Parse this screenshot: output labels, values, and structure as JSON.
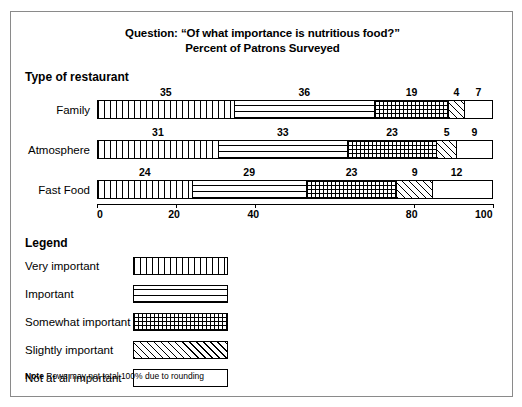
{
  "title": {
    "line1": "Question: “Of what importance is nutritious food?”",
    "line2": "Percent of Patrons Surveyed"
  },
  "type_heading": "Type of restaurant",
  "legend_heading": "Legend",
  "note": {
    "label": "Note",
    "text": " Rows may not total 100% due to rounding"
  },
  "chart_data": {
    "type": "bar",
    "orientation": "horizontal",
    "stacked": true,
    "title": "Question: “Of what importance is nutritious food?” Percent of Patrons Surveyed",
    "xlabel": "",
    "ylabel": "Type of restaurant",
    "xlim": [
      0,
      100
    ],
    "grid": false,
    "legend_position": "below",
    "categories": [
      "Family",
      "Atmosphere",
      "Fast Food"
    ],
    "tick_values": [
      0,
      20,
      40,
      80,
      100
    ],
    "tick_labels": [
      "0",
      "20",
      "40",
      "80",
      "100"
    ],
    "series": [
      {
        "name": "Very important",
        "pattern": "vertical-lines",
        "values": [
          35,
          31,
          24
        ]
      },
      {
        "name": "Important",
        "pattern": "horizontal-lines",
        "values": [
          36,
          33,
          29
        ]
      },
      {
        "name": "Somewhat important",
        "pattern": "cross-hatch",
        "values": [
          19,
          23,
          23
        ]
      },
      {
        "name": "Slightly important",
        "pattern": "diagonal-stripes",
        "values": [
          4,
          5,
          9
        ]
      },
      {
        "name": "Not at all important",
        "pattern": "blank",
        "values": [
          7,
          9,
          12
        ]
      }
    ],
    "rows": [
      {
        "label": "Family",
        "values": [
          35,
          36,
          19,
          4,
          7
        ]
      },
      {
        "label": "Atmosphere",
        "values": [
          31,
          33,
          23,
          5,
          9
        ]
      },
      {
        "label": "Fast Food",
        "values": [
          24,
          29,
          23,
          9,
          12
        ]
      }
    ]
  }
}
